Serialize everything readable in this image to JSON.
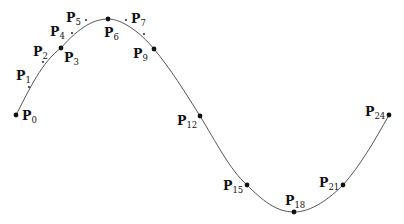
{
  "diagram": {
    "curve_color": "#555555",
    "points": [
      {
        "id": "P0",
        "base": "P",
        "sub": "0",
        "x": 16,
        "y": 115,
        "kind": "major",
        "lx": 22,
        "ly": 120
      },
      {
        "id": "P1",
        "base": "P",
        "sub": "1",
        "x": 29,
        "y": 87,
        "kind": "minor",
        "lx": 16,
        "ly": 80
      },
      {
        "id": "P2",
        "base": "P",
        "sub": "2",
        "x": 43,
        "y": 62,
        "kind": "minor",
        "lx": 33,
        "ly": 56
      },
      {
        "id": "P3",
        "base": "P",
        "sub": "3",
        "x": 61,
        "y": 48,
        "kind": "major",
        "lx": 64,
        "ly": 62
      },
      {
        "id": "P4",
        "base": "P",
        "sub": "4",
        "x": 72,
        "y": 33,
        "kind": "minor",
        "lx": 50,
        "ly": 36
      },
      {
        "id": "P5",
        "base": "P",
        "sub": "5",
        "x": 86,
        "y": 20,
        "kind": "minor",
        "lx": 66,
        "ly": 22
      },
      {
        "id": "P6",
        "base": "P",
        "sub": "6",
        "x": 108,
        "y": 19,
        "kind": "major",
        "lx": 104,
        "ly": 37
      },
      {
        "id": "P7",
        "base": "P",
        "sub": "7",
        "x": 126,
        "y": 20,
        "kind": "minor",
        "lx": 131,
        "ly": 23
      },
      {
        "id": "P8",
        "base": "",
        "sub": "",
        "x": 144,
        "y": 34,
        "kind": "minor",
        "lx": 0,
        "ly": 0
      },
      {
        "id": "P9",
        "base": "P",
        "sub": "9",
        "x": 154,
        "y": 49,
        "kind": "major",
        "lx": 133,
        "ly": 58
      },
      {
        "id": "P12",
        "base": "P",
        "sub": "12",
        "x": 200,
        "y": 116,
        "kind": "major",
        "lx": 177,
        "ly": 125
      },
      {
        "id": "P15",
        "base": "P",
        "sub": "15",
        "x": 247,
        "y": 185,
        "kind": "major",
        "lx": 223,
        "ly": 190
      },
      {
        "id": "P18",
        "base": "P",
        "sub": "18",
        "x": 294,
        "y": 212,
        "kind": "major",
        "lx": 285,
        "ly": 205
      },
      {
        "id": "P21",
        "base": "P",
        "sub": "21",
        "x": 343,
        "y": 185,
        "kind": "major",
        "lx": 319,
        "ly": 187
      },
      {
        "id": "P24",
        "base": "P",
        "sub": "24",
        "x": 389,
        "y": 115,
        "kind": "major",
        "lx": 365,
        "ly": 116
      }
    ],
    "path_d": "M16,115 C30,88 42,62 61,48 C80,26 95,19 108,19 C122,19 140,32 154,49 C170,68 185,92 200,116 C216,142 230,170 247,185 C262,200 276,212 294,212 C312,212 330,198 343,185 C360,166 375,140 389,115"
  }
}
